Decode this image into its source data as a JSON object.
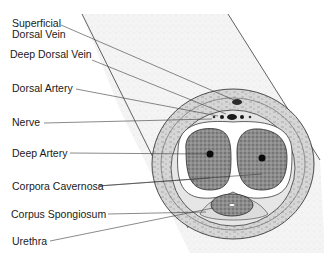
{
  "labels": {
    "superficial_line1": "Superficial",
    "superficial_line2": "Dorsal Vein",
    "deep_dorsal_vein": "Deep Dorsal Vein",
    "dorsal_artery": "Dorsal Artery",
    "nerve": "Nerve",
    "deep_artery": "Deep Artery",
    "corpora_cavernosa": "Corpora Cavernosa",
    "corpus_spongiosum": "Corpus Spongiosum",
    "urethra": "Urethra"
  },
  "colors": {
    "line": "#3a3a3a",
    "tissue_fill": "#cfcfcf",
    "erectile_fill": "#8a8a8a",
    "vessel": "#1a1a1a",
    "shaft_fill": "#f2f2f2"
  }
}
